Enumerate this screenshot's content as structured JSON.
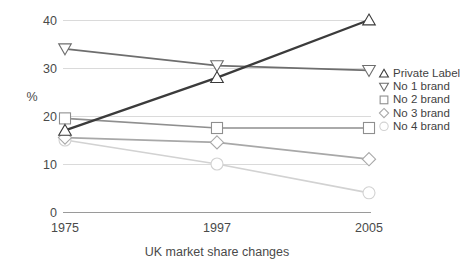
{
  "chart_data": {
    "type": "line",
    "title": "",
    "xlabel": "UK market share changes",
    "ylabel": "%",
    "categories": [
      "1975",
      "1997",
      "2005"
    ],
    "x": [
      1975,
      1997,
      2005
    ],
    "xticklabels": [
      "1975",
      "1997",
      "2005"
    ],
    "yticklabels": [
      "0",
      "10",
      "20",
      "30",
      "40"
    ],
    "yticks": [
      0,
      10,
      20,
      30,
      40
    ],
    "ylim": [
      0,
      40
    ],
    "grid": "horizontal",
    "legend_position": "right",
    "series": [
      {
        "name": "Private Label",
        "marker": "triangle-up",
        "color": "#3b3b3b",
        "values": [
          17.0,
          28.0,
          40.0
        ]
      },
      {
        "name": "No 1 brand",
        "marker": "triangle-down",
        "color": "#6e6e6e",
        "values": [
          34.0,
          30.5,
          29.5
        ]
      },
      {
        "name": "No 2 brand",
        "marker": "square",
        "color": "#8f8f8f",
        "values": [
          19.5,
          17.5,
          17.5
        ]
      },
      {
        "name": "No 3 brand",
        "marker": "diamond",
        "color": "#a8a8a8",
        "values": [
          15.5,
          14.5,
          11.0
        ]
      },
      {
        "name": "No 4 brand",
        "marker": "circle",
        "color": "#d2d2d2",
        "values": [
          15.0,
          10.0,
          4.0
        ]
      }
    ]
  },
  "legend": {
    "items": [
      {
        "label": "Private Label"
      },
      {
        "label": "No 1 brand"
      },
      {
        "label": "No 2 brand"
      },
      {
        "label": "No 3 brand"
      },
      {
        "label": "No 4 brand"
      }
    ]
  },
  "axes": {
    "y_axis_label": "%",
    "x_axis_title": "UK market share changes",
    "y_tick_0": "0",
    "y_tick_10": "10",
    "y_tick_20": "20",
    "y_tick_30": "30",
    "y_tick_40": "40",
    "x_tick_1": "1975",
    "x_tick_2": "1997",
    "x_tick_3": "2005"
  },
  "colors": {
    "gridline": "#d8d8d8",
    "axis_line": "#9a9a9a",
    "background": "#ffffff",
    "text": "#3f3f3f"
  }
}
